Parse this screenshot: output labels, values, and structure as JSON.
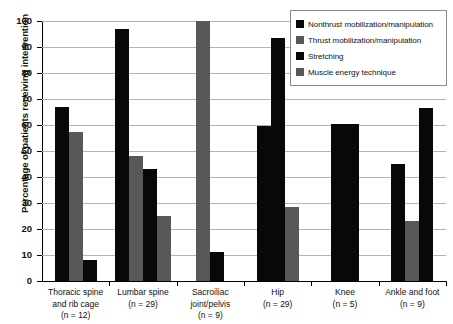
{
  "chart_data": {
    "type": "bar",
    "title": "",
    "xlabel": "",
    "ylabel": "Percentage of patients receiving intervention",
    "ylim": [
      0,
      100
    ],
    "ytick_step": 10,
    "yticks": [
      100,
      90,
      80,
      70,
      60,
      50,
      40,
      30,
      20,
      10,
      0
    ],
    "grid": true,
    "legend_position": "top-right",
    "categories": [
      "Thoracic spine and rib cage (n = 12)",
      "Lumbar spine (n = 29)",
      "Sacroiliac joint/pelvis (n = 9)",
      "Hip (n = 29)",
      "Knee (n = 5)",
      "Ankle and foot (n = 9)"
    ],
    "series": [
      {
        "name": "Nonthrust mobilization/manipulation",
        "color": "#080808",
        "values": [
          67,
          97,
          null,
          59.5,
          60.5,
          45
        ]
      },
      {
        "name": "Thrust mobilization/manipulation",
        "color": "#585858",
        "values": [
          57.5,
          48,
          100,
          null,
          null,
          23
        ]
      },
      {
        "name": "Stretching",
        "color": "#080808",
        "values": [
          8,
          43,
          11,
          93.5,
          60.5,
          66.5
        ]
      },
      {
        "name": "Muscle energy technique",
        "color": "#585858",
        "values": [
          null,
          25,
          null,
          28.5,
          null,
          null
        ]
      }
    ]
  },
  "axis": {
    "y_title": "Percentage of patients receiving intervention",
    "y_labels": [
      "100",
      "90",
      "80",
      "70",
      "60",
      "50",
      "40",
      "30",
      "20",
      "10",
      "0"
    ]
  },
  "groups": [
    {
      "id": "thoracic-spine-and-rib-cage",
      "lines": [
        "Thoracic spine",
        "and rib cage",
        "(n = 12)"
      ],
      "bars": [
        {
          "series": "nonthrust",
          "value": 67
        },
        {
          "series": "thrust",
          "value": 57.5
        },
        {
          "series": "stretching",
          "value": 8
        }
      ]
    },
    {
      "id": "lumbar-spine",
      "lines": [
        "Lumbar spine",
        "(n = 29)"
      ],
      "bars": [
        {
          "series": "nonthrust",
          "value": 97
        },
        {
          "series": "thrust",
          "value": 48
        },
        {
          "series": "stretching",
          "value": 43
        },
        {
          "series": "muscle",
          "value": 25
        }
      ]
    },
    {
      "id": "sacroiliac-joint-pelvis",
      "lines": [
        "Sacroiliac",
        "joint/pelvis",
        "(n = 9)"
      ],
      "bars": [
        {
          "series": "thrust",
          "value": 100
        },
        {
          "series": "stretching",
          "value": 11
        }
      ]
    },
    {
      "id": "hip",
      "lines": [
        "Hip",
        "(n = 29)"
      ],
      "bars": [
        {
          "series": "nonthrust",
          "value": 59.5
        },
        {
          "series": "stretching",
          "value": 93.5
        },
        {
          "series": "muscle",
          "value": 28.5
        }
      ]
    },
    {
      "id": "knee",
      "lines": [
        "Knee",
        "(n = 5)"
      ],
      "bars": [
        {
          "series": "nonthrust",
          "value": 60.5
        },
        {
          "series": "stretching",
          "value": 60.5
        }
      ]
    },
    {
      "id": "ankle-and-foot",
      "lines": [
        "Ankle and foot",
        "(n = 9)"
      ],
      "bars": [
        {
          "series": "nonthrust",
          "value": 45
        },
        {
          "series": "thrust",
          "value": 23
        },
        {
          "series": "stretching",
          "value": 66.5
        }
      ]
    }
  ],
  "legend": {
    "items": [
      {
        "label": "Nonthrust mobilization/manipulation",
        "swatch": "dark"
      },
      {
        "label": "Thrust mobilization/manipulation",
        "swatch": "gray"
      },
      {
        "label": "Stretching",
        "swatch": "dark"
      },
      {
        "label": "Muscle energy technique",
        "swatch": "gray"
      }
    ]
  },
  "colors": {
    "dark": "#080808",
    "gray": "#585858",
    "grid": "#b4b4b4",
    "axis": "#000000",
    "legend_border": "#8a8a8a"
  }
}
